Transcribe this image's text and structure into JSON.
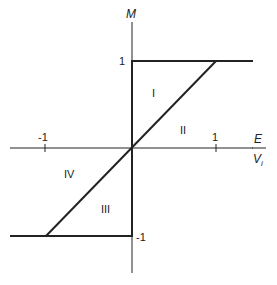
{
  "axes": {
    "y_label": "M",
    "x_label_num": "E",
    "x_label_den": "V",
    "x_label_den_sub": "i"
  },
  "ticks": {
    "x_neg": "-1",
    "x_pos": "1",
    "y_pos": "1",
    "y_neg": "-1"
  },
  "regions": [
    "I",
    "II",
    "III",
    "IV"
  ]
}
